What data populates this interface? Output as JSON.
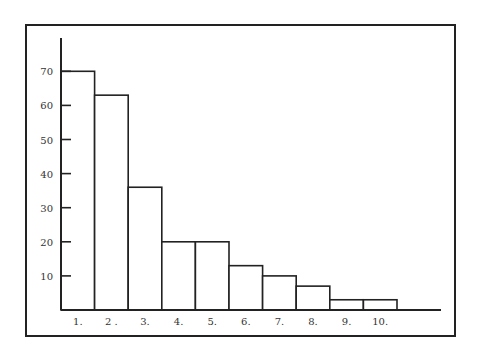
{
  "chart_data": {
    "type": "bar",
    "title": "",
    "xlabel": "",
    "ylabel": "",
    "categories": [
      "1.",
      "2 .",
      "3.",
      "4.",
      "5.",
      "6.",
      "7.",
      "8.",
      "9.",
      "10."
    ],
    "values": [
      70,
      63,
      36,
      20,
      20,
      13,
      10,
      7,
      3,
      3
    ],
    "ylim": [
      0,
      80
    ],
    "yticks": [
      10,
      20,
      30,
      40,
      50,
      60,
      70
    ],
    "ytick_labels": [
      "10",
      "20",
      "30",
      "40",
      "50",
      "60",
      "70"
    ],
    "grid": false,
    "legend": null,
    "bar_fill": "#ffffff",
    "bar_stroke": "#222222"
  }
}
